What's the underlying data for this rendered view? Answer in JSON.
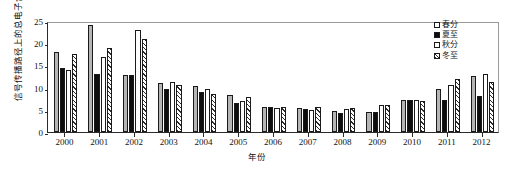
{
  "chart_data": {
    "type": "bar",
    "title": "",
    "xlabel": "年份",
    "ylabel": "信号传播路径上的总电子含量/TECU",
    "ylim": [
      0,
      25
    ],
    "yticks": [
      0,
      5,
      10,
      15,
      20,
      25
    ],
    "grid": false,
    "legend_position": "right",
    "categories": [
      "2000",
      "2001",
      "2002",
      "2003",
      "2004",
      "2005",
      "2006",
      "2007",
      "2008",
      "2009",
      "2010",
      "2011",
      "2012"
    ],
    "series": [
      {
        "name": "春分",
        "fill": "gray",
        "values": [
          18.0,
          24.0,
          12.8,
          11.0,
          10.3,
          8.4,
          5.6,
          5.5,
          4.7,
          4.6,
          7.1,
          9.6,
          12.6
        ]
      },
      {
        "name": "夏至",
        "fill": "black",
        "values": [
          14.5,
          13.0,
          12.8,
          9.7,
          8.9,
          6.5,
          5.6,
          5.2,
          4.2,
          4.4,
          7.2,
          7.3,
          8.0
        ]
      },
      {
        "name": "秋分",
        "fill": "white",
        "values": [
          14.0,
          16.8,
          23.0,
          11.3,
          9.7,
          7.0,
          5.4,
          4.9,
          5.1,
          6.1,
          7.1,
          10.6,
          13.1
        ]
      },
      {
        "name": "冬至",
        "fill": "hatched",
        "values": [
          17.5,
          19.0,
          21.0,
          10.6,
          8.5,
          7.8,
          5.7,
          5.6,
          5.4,
          6.0,
          7.0,
          12.0,
          11.2
        ]
      }
    ]
  },
  "legend": {
    "items": [
      {
        "label": "春分"
      },
      {
        "label": "夏至"
      },
      {
        "label": "秋分"
      },
      {
        "label": "冬至"
      }
    ]
  },
  "colors": {
    "spring": "#b5b5b5",
    "summer": "#0d0d0d",
    "autumn": "#ffffff",
    "winter": "#ffffff",
    "axis": "#2b2b2b"
  }
}
